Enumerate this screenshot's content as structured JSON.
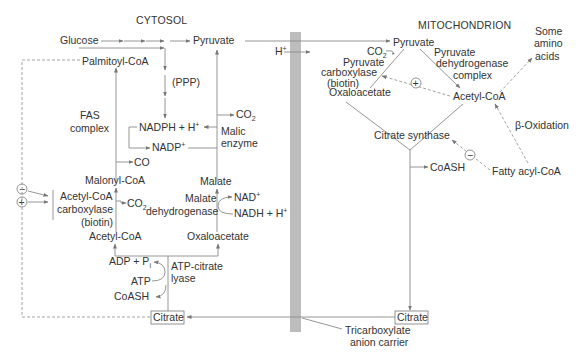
{
  "diagram": {
    "compartments": {
      "cytosol": "CYTOSOL",
      "mitochondrion": "MITOCHONDRION"
    },
    "cytosol": {
      "glucose": "Glucose",
      "pyruvate": "Pyruvate",
      "palmitoyl_coa": "Palmitoyl-CoA",
      "ppp": "(PPP)",
      "fas_line1": "FAS",
      "fas_line2": "complex",
      "nadph": "NADPH + H",
      "nadph_sup": "+",
      "nadp": "NADP",
      "nadp_sup": "+",
      "co2_malic": "CO",
      "co2_malic_sub": "2",
      "malic_line1": "Malic",
      "malic_line2": "enzyme",
      "co": "CO",
      "malonyl_coa": "Malonyl-CoA",
      "acc_line1": "Acetyl-CoA",
      "acc_line2": "carboxylase",
      "acc_line3": "(biotin)",
      "co2_acc": "CO",
      "co2_acc_sub": "2",
      "malate": "Malate",
      "mdh_line1": "Malate",
      "mdh_line2": "dehydrogenase",
      "nad": "NAD",
      "nad_sup": "+",
      "nadh": "NADH + H",
      "nadh_sup": "+",
      "acetyl_coa": "Acetyl-CoA",
      "oxaloacetate": "Oxaloacetate",
      "adp": "ADP + P",
      "adp_sub": "i",
      "atp": "ATP",
      "coash": "CoASH",
      "atp_citrate_line1": "ATP-citrate",
      "atp_citrate_line2": "lyase",
      "citrate": "Citrate",
      "inhibit_symbol": "−",
      "activate_symbol": "+"
    },
    "membrane": {
      "h_plus": "H",
      "h_plus_sup": "+",
      "carrier_line1": "Tricarboxylate",
      "carrier_line2": "anion carrier"
    },
    "mitochondrion": {
      "pyruvate": "Pyruvate",
      "co2": "CO",
      "co2_sub": "2",
      "pc_line1": "Pyruvate",
      "pc_line2": "carboxylase",
      "pc_line3": "(biotin)",
      "oxaloacetate": "Oxaloacetate",
      "pdh_line1": "Pyruvate",
      "pdh_line2": "dehydrogenase",
      "pdh_line3": "complex",
      "acetyl_coa": "Acetyl-CoA",
      "amino_line1": "Some",
      "amino_line2": "amino",
      "amino_line3": "acids",
      "beta_oxidation": "β-Oxidation",
      "citrate_synthase": "Citrate synthase",
      "coash": "CoASH",
      "fatty_acyl_coa": "Fatty acyl-CoA",
      "citrate": "Citrate",
      "activate_symbol": "+",
      "inhibit_symbol": "−"
    }
  },
  "colors": {
    "text": "#333333",
    "line": "#8a8a8a",
    "membrane": "#bdbdbd",
    "background": "#ffffff"
  }
}
